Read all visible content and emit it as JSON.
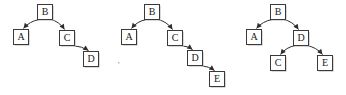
{
  "figure": {
    "kind": "binary-tree-sequence",
    "background_color": "#ffffff",
    "node_fill": "#ffffff",
    "node_border_color": "#3a3a3a",
    "node_shadow_color": "#c9c9c9",
    "edge_color": "#2e2e2e",
    "label_color": "#1a1a1a",
    "box_width": 15,
    "box_height": 15,
    "trees": [
      {
        "id": "tree-1",
        "name": "tree-diagram-1",
        "nodes": [
          {
            "id": "n1-b",
            "label": "B",
            "x": 45,
            "y": 12
          },
          {
            "id": "n1-a",
            "label": "A",
            "x": 21,
            "y": 37
          },
          {
            "id": "n1-c",
            "label": "C",
            "x": 67,
            "y": 38
          },
          {
            "id": "n1-d",
            "label": "D",
            "x": 91,
            "y": 59
          }
        ],
        "edges": [
          {
            "id": "e1-ba",
            "from": "n1-b",
            "to": "n1-a",
            "label": "B-to-A"
          },
          {
            "id": "e1-bc",
            "from": "n1-b",
            "to": "n1-c",
            "label": "B-to-C"
          },
          {
            "id": "e1-cd",
            "from": "n1-c",
            "to": "n1-d",
            "label": "C-to-D"
          }
        ]
      },
      {
        "id": "tree-2",
        "name": "tree-diagram-2",
        "nodes": [
          {
            "id": "n2-b",
            "label": "B",
            "x": 40,
            "y": 12
          },
          {
            "id": "n2-a",
            "label": "A",
            "x": 17,
            "y": 37
          },
          {
            "id": "n2-c",
            "label": "C",
            "x": 63,
            "y": 38
          },
          {
            "id": "n2-d",
            "label": "D",
            "x": 83,
            "y": 58
          },
          {
            "id": "n2-e",
            "label": "E",
            "x": 105,
            "y": 79
          }
        ],
        "edges": [
          {
            "id": "e2-ba",
            "from": "n2-b",
            "to": "n2-a",
            "label": "B-to-A"
          },
          {
            "id": "e2-bc",
            "from": "n2-b",
            "to": "n2-c",
            "label": "B-to-C"
          },
          {
            "id": "e2-cd",
            "from": "n2-c",
            "to": "n2-d",
            "label": "C-to-D"
          },
          {
            "id": "e2-de",
            "from": "n2-d",
            "to": "n2-e",
            "label": "D-to-E"
          }
        ]
      },
      {
        "id": "tree-3",
        "name": "tree-diagram-3",
        "nodes": [
          {
            "id": "n3-b",
            "label": "B",
            "x": 48,
            "y": 12
          },
          {
            "id": "n3-a",
            "label": "A",
            "x": 24,
            "y": 37
          },
          {
            "id": "n3-d",
            "label": "D",
            "x": 71,
            "y": 38
          },
          {
            "id": "n3-c",
            "label": "C",
            "x": 48,
            "y": 63
          },
          {
            "id": "n3-e",
            "label": "E",
            "x": 95,
            "y": 63
          }
        ],
        "edges": [
          {
            "id": "e3-ba",
            "from": "n3-b",
            "to": "n3-a",
            "label": "B-to-A"
          },
          {
            "id": "e3-bd",
            "from": "n3-b",
            "to": "n3-d",
            "label": "B-to-D"
          },
          {
            "id": "e3-dc",
            "from": "n3-d",
            "to": "n3-c",
            "label": "D-to-C"
          },
          {
            "id": "e3-de",
            "from": "n3-d",
            "to": "n3-e",
            "label": "D-to-E"
          }
        ]
      }
    ],
    "specks": [
      {
        "x": 118,
        "y": 62
      }
    ]
  }
}
